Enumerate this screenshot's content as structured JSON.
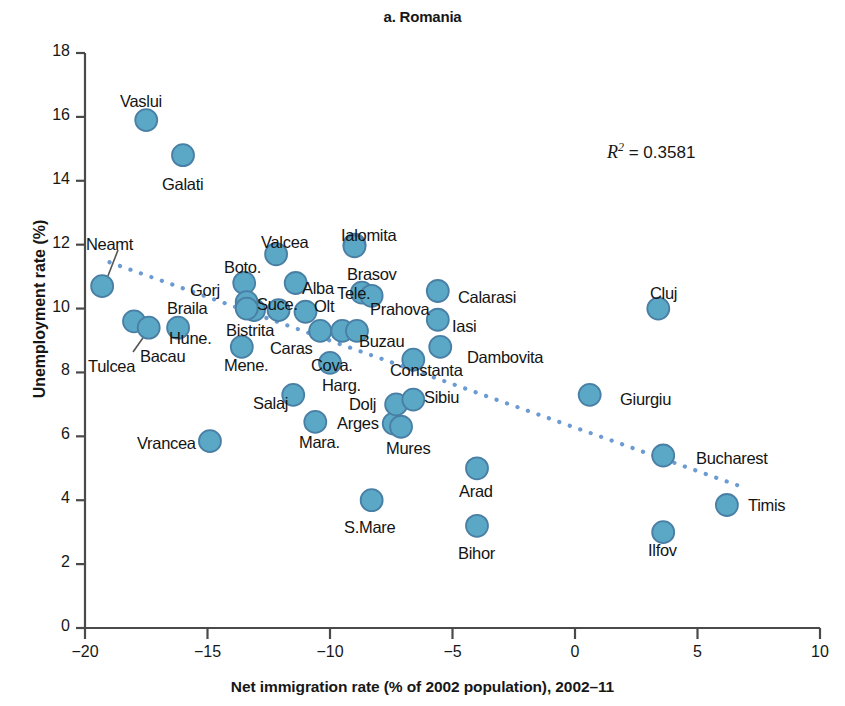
{
  "chart_data": {
    "type": "scatter",
    "title": "a. Romania",
    "xlabel": "Net immigration rate (% of 2002 population), 2002–11",
    "ylabel": "Unemployment rate (%)",
    "xlim": [
      -20,
      10
    ],
    "ylim": [
      0,
      18
    ],
    "xticks": [
      "-20",
      "-15",
      "-10",
      "-5",
      "0",
      "5",
      "10"
    ],
    "yticks": [
      "0",
      "2",
      "4",
      "6",
      "8",
      "10",
      "12",
      "14",
      "16",
      "18"
    ],
    "grid": false,
    "legend": "none",
    "annotations": [
      {
        "id": "r2",
        "prefix": "R",
        "superscript": "2",
        "text": " = 0.3581",
        "full": "R2 = 0.3581"
      }
    ],
    "trendline": {
      "style": "dotted",
      "color": "#6b9bd2",
      "x_start": -19.0,
      "y_start": 11.45,
      "x_end": 6.7,
      "y_end": 4.45
    },
    "marker": {
      "fill": "#5aa8c6",
      "stroke": "#4a7fa5",
      "radius_px": 11
    },
    "points": [
      {
        "label": "Vaslui",
        "x": -17.5,
        "y": 15.9,
        "lx": 120,
        "ly": 92,
        "leader": false
      },
      {
        "label": "Galati",
        "x": -16.0,
        "y": 14.8,
        "lx": 162,
        "ly": 175,
        "leader": false
      },
      {
        "label": "Neamt",
        "x": -19.3,
        "y": 10.7,
        "lx": 86,
        "ly": 235,
        "leader": true,
        "leader_path": "M 118 250 L 106 281"
      },
      {
        "label": "Tulcea",
        "x": -18.0,
        "y": 9.6,
        "lx": 88,
        "ly": 357,
        "leader": true,
        "leader_path": "M 133 352 L 152 325"
      },
      {
        "label": "Bacau",
        "x": -17.4,
        "y": 9.4,
        "lx": 140,
        "ly": 347,
        "leader": false
      },
      {
        "label": "Hune.",
        "x": -16.2,
        "y": 9.4,
        "lx": 169,
        "ly": 329,
        "leader": false
      },
      {
        "label": "Vrancea",
        "x": -14.9,
        "y": 5.85,
        "lx": 137,
        "ly": 434,
        "leader": false
      },
      {
        "label": "Mene.",
        "x": -13.6,
        "y": 8.8,
        "lx": 224,
        "ly": 356,
        "leader": false
      },
      {
        "label": "Braila",
        "x": -13.1,
        "y": 9.95,
        "lx": 167,
        "ly": 299,
        "leader": false
      },
      {
        "label": "Gorj",
        "x": -13.5,
        "y": 10.8,
        "lx": 190,
        "ly": 281,
        "leader": false
      },
      {
        "label": "Boto.",
        "x": -13.4,
        "y": 10.2,
        "lx": 224,
        "ly": 258,
        "leader": false
      },
      {
        "label": "Bistrita",
        "x": -13.4,
        "y": 10.0,
        "lx": 226,
        "ly": 321,
        "leader": false
      },
      {
        "label": "Valcea",
        "x": -12.2,
        "y": 11.7,
        "lx": 261,
        "ly": 233,
        "leader": false
      },
      {
        "label": "Suce.",
        "x": -12.1,
        "y": 9.95,
        "lx": 257,
        "ly": 295,
        "leader": false
      },
      {
        "label": "Salaj",
        "x": -11.5,
        "y": 7.3,
        "lx": 253,
        "ly": 394,
        "leader": false
      },
      {
        "label": "Alba",
        "x": -11.4,
        "y": 10.8,
        "lx": 302,
        "ly": 279,
        "leader": false
      },
      {
        "label": "Caras",
        "x": -11.0,
        "y": 9.9,
        "lx": 270,
        "ly": 339,
        "leader": false
      },
      {
        "label": "Mara.",
        "x": -10.6,
        "y": 6.45,
        "lx": 299,
        "ly": 433,
        "leader": false
      },
      {
        "label": "Olt",
        "x": -10.4,
        "y": 9.3,
        "lx": 314,
        "ly": 297,
        "leader": false
      },
      {
        "label": "Harg.",
        "x": -10.0,
        "y": 8.3,
        "lx": 322,
        "ly": 376,
        "leader": false
      },
      {
        "label": "Cova.",
        "x": -9.5,
        "y": 9.3,
        "lx": 311,
        "ly": 356,
        "leader": false
      },
      {
        "label": "Ialomita",
        "x": -9.0,
        "y": 12.0,
        "lx": 341,
        "ly": 226,
        "leader": false
      },
      {
        "label": "Brasov",
        "x": -9.0,
        "y": 11.95,
        "lx": 347,
        "ly": 265,
        "leader": false
      },
      {
        "label": "Tele.",
        "x": -8.7,
        "y": 10.5,
        "lx": 337,
        "ly": 284,
        "leader": false
      },
      {
        "label": "Buzau",
        "x": -8.9,
        "y": 9.3,
        "lx": 359,
        "ly": 332,
        "leader": false
      },
      {
        "label": "S.Mare",
        "x": -8.3,
        "y": 4.0,
        "lx": 344,
        "ly": 518,
        "leader": false
      },
      {
        "label": "Arges",
        "x": -7.4,
        "y": 6.4,
        "lx": 337,
        "ly": 414,
        "leader": false
      },
      {
        "label": "Dolj",
        "x": -7.3,
        "y": 7.0,
        "lx": 349,
        "ly": 395,
        "leader": false
      },
      {
        "label": "Prahova",
        "x": -8.3,
        "y": 10.4,
        "lx": 370,
        "ly": 300,
        "leader": false
      },
      {
        "label": "Mures",
        "x": -7.1,
        "y": 6.3,
        "lx": 386,
        "ly": 439,
        "leader": false
      },
      {
        "label": "Constanta",
        "x": -6.6,
        "y": 8.4,
        "lx": 390,
        "ly": 361,
        "leader": false
      },
      {
        "label": "Sibiu",
        "x": -6.6,
        "y": 7.15,
        "lx": 424,
        "ly": 388,
        "leader": false
      },
      {
        "label": "Calarasi",
        "x": -5.6,
        "y": 10.55,
        "lx": 458,
        "ly": 288,
        "leader": false
      },
      {
        "label": "Iasi",
        "x": -5.6,
        "y": 9.65,
        "lx": 452,
        "ly": 317,
        "leader": false
      },
      {
        "label": "Dambovita",
        "x": -5.5,
        "y": 8.8,
        "lx": 467,
        "ly": 348,
        "leader": false
      },
      {
        "label": "Arad",
        "x": -4.0,
        "y": 5.0,
        "lx": 459,
        "ly": 482,
        "leader": false
      },
      {
        "label": "Bihor",
        "x": -4.0,
        "y": 3.2,
        "lx": 458,
        "ly": 544,
        "leader": false
      },
      {
        "label": "Giurgiu",
        "x": 0.6,
        "y": 7.3,
        "lx": 620,
        "ly": 390,
        "leader": false
      },
      {
        "label": "Cluj",
        "x": 3.4,
        "y": 10.0,
        "lx": 650,
        "ly": 284,
        "leader": false
      },
      {
        "label": "Ilfov",
        "x": 3.6,
        "y": 3.0,
        "lx": 648,
        "ly": 541,
        "leader": false
      },
      {
        "label": "Bucharest",
        "x": 3.6,
        "y": 5.4,
        "lx": 696,
        "ly": 449,
        "leader": false
      },
      {
        "label": "Timis",
        "x": 6.2,
        "y": 3.85,
        "lx": 748,
        "ly": 496,
        "leader": false
      }
    ]
  }
}
